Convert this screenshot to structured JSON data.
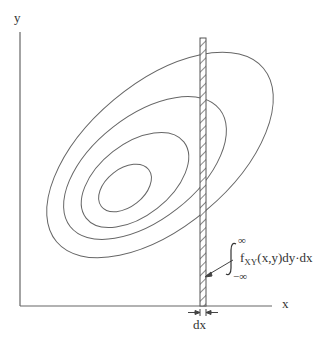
{
  "diagram": {
    "title": "",
    "axes": {
      "x_label": "x",
      "y_label": "y"
    },
    "contours": {
      "description": "Concentric tilted elliptical contours of joint density fXY(x,y)",
      "count": 4
    },
    "strip": {
      "width_label": "dx",
      "annotation": {
        "upper_limit": "∞",
        "lower_limit": "−∞",
        "integral_sign": "∫",
        "integrand": "f",
        "subscript": "XY",
        "expression": "(x,y)dy·dx"
      }
    },
    "colors": {
      "line": "#555555",
      "text": "#333333",
      "background": "#ffffff"
    }
  }
}
